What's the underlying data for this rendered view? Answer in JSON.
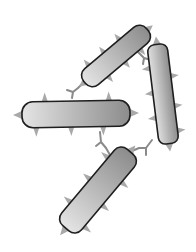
{
  "figure": {
    "width": 196,
    "height": 252,
    "colors": {
      "background": "#ffffff",
      "rod_outline": "#1e1e1e",
      "rod_fill_light": "#e2e2e2",
      "rod_fill_dark": "#8f8f8f",
      "spike": "#a9a9a9",
      "antibody": "#8a8a8a"
    },
    "bacteria": [
      {
        "id": "top",
        "cx": 116,
        "cy": 56,
        "length": 82,
        "width": 21,
        "angle": -40
      },
      {
        "id": "left",
        "cx": 76,
        "cy": 114,
        "length": 108,
        "width": 26,
        "angle": -1
      },
      {
        "id": "right",
        "cx": 163,
        "cy": 94,
        "length": 100,
        "width": 20,
        "angle": 83
      },
      {
        "id": "bottom",
        "cx": 98,
        "cy": 190,
        "length": 100,
        "width": 26,
        "angle": -50
      }
    ],
    "antibodies": [
      {
        "id": "ab-top-left",
        "x": 72,
        "y": 88,
        "angle": 200
      },
      {
        "id": "ab-top-right",
        "x": 145,
        "y": 60,
        "angle": 30
      },
      {
        "id": "ab-left-bottom",
        "x": 100,
        "y": 150,
        "angle": 150
      },
      {
        "id": "ab-right-bottom",
        "x": 143,
        "y": 150,
        "angle": 20
      }
    ]
  }
}
